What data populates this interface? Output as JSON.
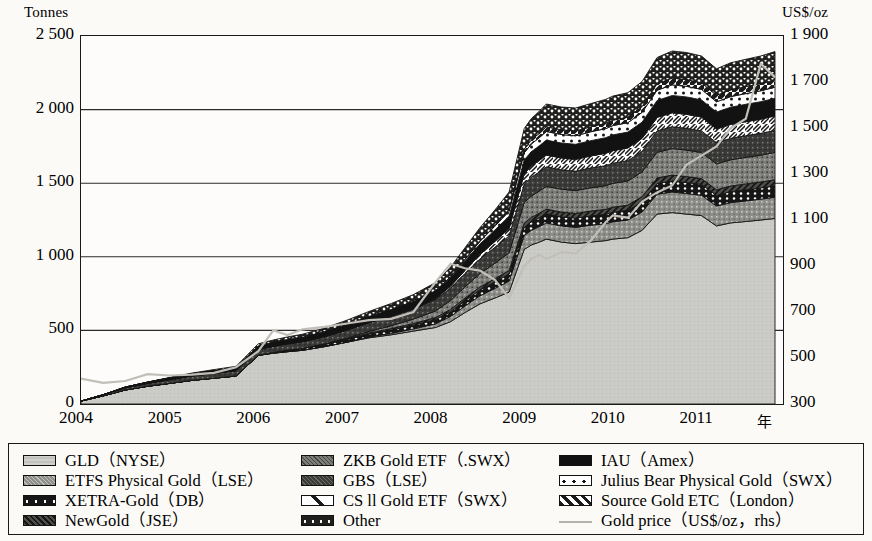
{
  "axes": {
    "left_title": "Tonnes",
    "right_title": "US$/oz",
    "x_unit": "年",
    "left_ticks": [
      "2 500",
      "2 000",
      "1 500",
      "1 000",
      "500",
      "0"
    ],
    "right_ticks": [
      "1 900",
      "1 700",
      "1 500",
      "1 300",
      "1 100",
      "900",
      "700",
      "500",
      "300"
    ],
    "x_ticks": [
      "2004",
      "2005",
      "2006",
      "2007",
      "2008",
      "2009",
      "2010",
      "2011"
    ]
  },
  "legend": {
    "col1": [
      {
        "label": "GLD（NYSE）",
        "pattern": "light-gray",
        "color": "#c9c9c9"
      },
      {
        "label": "ETFS Physical Gold（LSE）",
        "pattern": "mid-gray-speckle",
        "color": "#8f8f8f"
      },
      {
        "label": "XETRA-Gold（DB）",
        "pattern": "black-dots",
        "color": "#1a1a1a"
      },
      {
        "label": "NewGold（JSE）",
        "pattern": "dark-hatch",
        "color": "#4a4a4a"
      }
    ],
    "col2": [
      {
        "label": "ZKB Gold ETF（.SWX）",
        "pattern": "gray-speckle",
        "color": "#7a7a7a"
      },
      {
        "label": "GBS（LSE）",
        "pattern": "dark-speckle",
        "color": "#3a3a3a"
      },
      {
        "label": "CS ll Gold ETF（SWX）",
        "pattern": "white-diagonal",
        "color": "#ffffff"
      },
      {
        "label": "Other",
        "pattern": "dark-dots",
        "color": "#262626"
      }
    ],
    "col3": [
      {
        "label": "IAU（Amex）",
        "pattern": "solid-black",
        "color": "#111111"
      },
      {
        "label": "Julius Bear Physical Gold（SWX）",
        "pattern": "white-dots",
        "color": "#ffffff"
      },
      {
        "label": "Source Gold ETC（London）",
        "pattern": "diagonal-dark",
        "color": "#333333"
      },
      {
        "label": "Gold price（US$/oz，rhs）",
        "pattern": "thin-line",
        "color": "#b5b2ad"
      }
    ]
  },
  "chart_data": {
    "type": "area",
    "title": "",
    "xlabel": "年",
    "ylabel": "Tonnes",
    "y2label": "US$/oz",
    "ylim": [
      0,
      2500
    ],
    "y2lim": [
      300,
      1900
    ],
    "xlim": [
      "2004",
      "2011.9"
    ],
    "grid": true,
    "legend_position": "bottom",
    "stacked": true,
    "x": [
      2004.0,
      2004.25,
      2004.5,
      2004.75,
      2005.0,
      2005.25,
      2005.5,
      2005.75,
      2006.0,
      2006.17,
      2006.33,
      2006.5,
      2006.75,
      2007.0,
      2007.25,
      2007.5,
      2007.75,
      2008.0,
      2008.17,
      2008.33,
      2008.5,
      2008.67,
      2008.83,
      2009.0,
      2009.08,
      2009.17,
      2009.25,
      2009.42,
      2009.58,
      2009.75,
      2009.92,
      2010.0,
      2010.17,
      2010.33,
      2010.5,
      2010.67,
      2010.83,
      2011.0,
      2011.17,
      2011.33,
      2011.5,
      2011.67,
      2011.83
    ],
    "series": [
      {
        "name": "GLD（NYSE）",
        "values": [
          20,
          55,
          95,
          120,
          140,
          160,
          175,
          190,
          330,
          345,
          355,
          365,
          390,
          420,
          450,
          470,
          495,
          520,
          560,
          620,
          680,
          720,
          760,
          1050,
          1080,
          1100,
          1120,
          1100,
          1090,
          1100,
          1110,
          1120,
          1130,
          1180,
          1290,
          1300,
          1290,
          1280,
          1210,
          1230,
          1240,
          1250,
          1260
        ]
      },
      {
        "name": "ETFS Physical Gold（LSE）",
        "values": [
          0,
          0,
          0,
          0,
          0,
          0,
          0,
          0,
          0,
          0,
          0,
          0,
          0,
          0,
          5,
          10,
          15,
          25,
          35,
          45,
          55,
          65,
          75,
          95,
          100,
          105,
          110,
          110,
          110,
          115,
          115,
          118,
          120,
          125,
          135,
          140,
          140,
          138,
          135,
          138,
          140,
          142,
          145
        ]
      },
      {
        "name": "XETRA-Gold（DB）",
        "values": [
          0,
          0,
          0,
          0,
          0,
          0,
          0,
          0,
          0,
          5,
          10,
          12,
          15,
          18,
          20,
          22,
          25,
          28,
          32,
          36,
          40,
          44,
          48,
          55,
          58,
          60,
          62,
          62,
          62,
          63,
          64,
          65,
          66,
          68,
          72,
          75,
          75,
          74,
          72,
          74,
          75,
          76,
          78
        ]
      },
      {
        "name": "NewGold（JSE）",
        "values": [
          0,
          0,
          0,
          0,
          0,
          0,
          0,
          0,
          0,
          0,
          0,
          0,
          3,
          5,
          8,
          10,
          12,
          14,
          16,
          18,
          20,
          22,
          24,
          28,
          30,
          31,
          32,
          32,
          32,
          33,
          34,
          34,
          35,
          36,
          38,
          40,
          40,
          39,
          38,
          39,
          40,
          40,
          41
        ]
      },
      {
        "name": "ZKB Gold ETF（.SWX）",
        "values": [
          0,
          0,
          0,
          0,
          0,
          0,
          0,
          0,
          0,
          0,
          0,
          0,
          0,
          5,
          10,
          20,
          30,
          45,
          60,
          75,
          90,
          105,
          120,
          140,
          145,
          150,
          155,
          155,
          156,
          158,
          160,
          162,
          164,
          168,
          175,
          180,
          180,
          178,
          176,
          178,
          180,
          182,
          185
        ]
      },
      {
        "name": "GBS（LSE）",
        "values": [
          0,
          8,
          15,
          20,
          25,
          30,
          33,
          36,
          40,
          42,
          44,
          46,
          50,
          55,
          60,
          65,
          70,
          78,
          85,
          92,
          100,
          108,
          115,
          125,
          128,
          130,
          132,
          132,
          132,
          134,
          136,
          137,
          138,
          140,
          145,
          148,
          148,
          146,
          145,
          146,
          148,
          149,
          150
        ]
      },
      {
        "name": "CS ll Gold ETF（SWX）",
        "values": [
          0,
          0,
          0,
          0,
          0,
          0,
          0,
          0,
          0,
          0,
          0,
          0,
          0,
          0,
          0,
          0,
          0,
          5,
          12,
          20,
          30,
          40,
          50,
          70,
          75,
          78,
          80,
          80,
          80,
          82,
          84,
          85,
          86,
          88,
          92,
          95,
          95,
          94,
          92,
          94,
          95,
          96,
          98
        ]
      },
      {
        "name": "IAU（Amex）",
        "values": [
          0,
          0,
          5,
          8,
          12,
          15,
          18,
          20,
          25,
          27,
          29,
          31,
          34,
          38,
          42,
          46,
          50,
          55,
          60,
          66,
          72,
          78,
          84,
          95,
          98,
          100,
          102,
          102,
          102,
          104,
          106,
          107,
          108,
          110,
          115,
          118,
          118,
          117,
          115,
          117,
          118,
          119,
          120
        ]
      },
      {
        "name": "Julius Bear Physical Gold（SWX）",
        "values": [
          0,
          0,
          0,
          0,
          0,
          0,
          0,
          0,
          0,
          0,
          0,
          0,
          0,
          0,
          0,
          0,
          0,
          0,
          5,
          10,
          18,
          26,
          34,
          48,
          52,
          55,
          58,
          58,
          58,
          60,
          62,
          63,
          64,
          66,
          70,
          72,
          72,
          71,
          70,
          72,
          73,
          74,
          75
        ]
      },
      {
        "name": "Source Gold ETC（London）",
        "values": [
          0,
          0,
          0,
          0,
          0,
          0,
          0,
          0,
          0,
          0,
          0,
          0,
          0,
          0,
          0,
          0,
          0,
          0,
          0,
          0,
          0,
          5,
          12,
          25,
          28,
          30,
          32,
          32,
          33,
          34,
          36,
          37,
          38,
          40,
          44,
          46,
          46,
          45,
          44,
          46,
          47,
          48,
          50
        ]
      },
      {
        "name": "Other",
        "values": [
          0,
          0,
          0,
          0,
          3,
          5,
          8,
          10,
          14,
          16,
          18,
          20,
          24,
          28,
          34,
          40,
          46,
          55,
          65,
          78,
          92,
          105,
          118,
          140,
          145,
          150,
          155,
          155,
          156,
          158,
          162,
          164,
          166,
          170,
          178,
          184,
          184,
          182,
          180,
          184,
          186,
          188,
          192
        ]
      }
    ],
    "gold_price": {
      "name": "Gold price（US$/oz，rhs）",
      "unit": "US$/oz",
      "axis": "right",
      "values": [
        410,
        392,
        400,
        430,
        424,
        428,
        435,
        460,
        530,
        620,
        600,
        625,
        635,
        650,
        665,
        670,
        700,
        830,
        910,
        890,
        880,
        840,
        760,
        900,
        930,
        950,
        930,
        960,
        955,
        1010,
        1090,
        1120,
        1110,
        1180,
        1220,
        1250,
        1340,
        1380,
        1420,
        1500,
        1540,
        1780,
        1720
      ]
    }
  }
}
